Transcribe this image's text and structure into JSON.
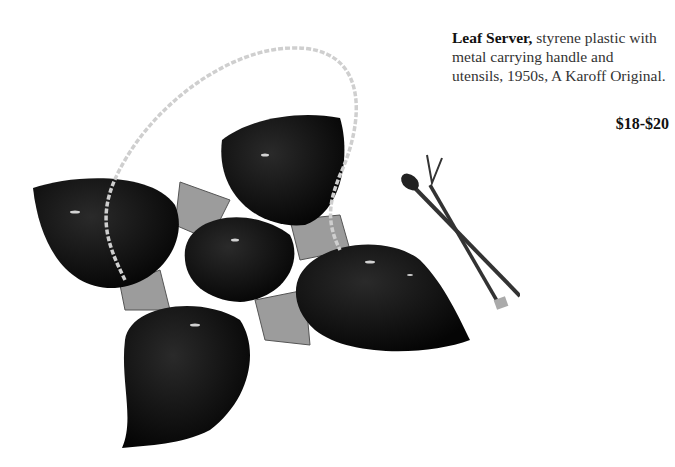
{
  "caption": {
    "title": "Leaf Server,",
    "description": " styrene plastic with metal carrying handle and utensils, 1950s, A Karoff Original."
  },
  "price": "$18-$20",
  "image": {
    "subject": "black leaf-shaped five-bowl server with twisted metal handle, spoon and fork utensils",
    "colors": {
      "plastic": "#0a0a0a",
      "leaf_accent": "#9a9a9a",
      "handle": "#cfcfcf",
      "background": "#ffffff"
    }
  }
}
